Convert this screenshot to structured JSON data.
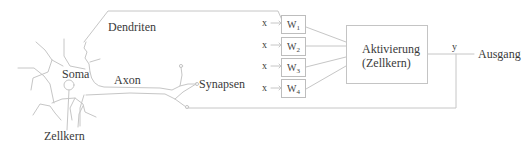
{
  "diagram": {
    "type": "neuron-vs-artificial-neuron",
    "biological_labels": {
      "dendrites": "Dendriten",
      "soma": "Soma",
      "axon": "Axon",
      "synapses": "Synapsen",
      "nucleus": "Zellkern"
    },
    "inputs": [
      {
        "label": "x",
        "weight": "W",
        "index": "1"
      },
      {
        "label": "x",
        "weight": "W",
        "index": "2"
      },
      {
        "label": "x",
        "weight": "W",
        "index": "3"
      },
      {
        "label": "x",
        "weight": "W",
        "index": "4"
      }
    ],
    "activation": {
      "line1": "Aktivierung",
      "line2": "(Zellkern)"
    },
    "output": {
      "symbol": "y",
      "label": "Ausgang"
    },
    "colors": {
      "line": "#c8c8c8",
      "text": "#3a3a3a",
      "background": "#ffffff"
    }
  }
}
